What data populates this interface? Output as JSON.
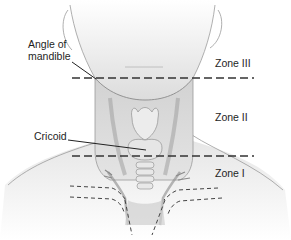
{
  "diagram": {
    "labels": {
      "angle_of_mandible": "Angle of mandible",
      "cricoid": "Cricoid",
      "zone_3": "Zone III",
      "zone_2": "Zone II",
      "zone_1": "Zone I"
    },
    "boundaries": [
      {
        "name": "Zone III / Zone II boundary",
        "landmark": "Angle of mandible",
        "y": 78
      },
      {
        "name": "Zone II / Zone I boundary",
        "landmark": "Cricoid",
        "y": 156
      }
    ],
    "colors": {
      "skin_light": "#f2f2f2",
      "skin_mid": "#d9d9d9",
      "outline": "#8a8a8a",
      "dash": "#333333",
      "text": "#1e1e1e"
    }
  }
}
